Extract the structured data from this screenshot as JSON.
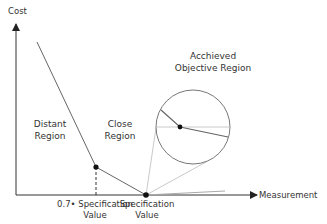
{
  "diagram": {
    "y_axis_label": "Cost",
    "x_axis_label": "Measurement",
    "regions": {
      "distant": [
        "Distant",
        "Region"
      ],
      "close": [
        "Close",
        "Region"
      ],
      "achieved": [
        "Acchieved",
        "Objective Region"
      ]
    },
    "x_ticks": {
      "tick1": [
        "0.7• Specification",
        "Value"
      ],
      "tick2": [
        "Specification",
        "Value"
      ]
    },
    "colors": {
      "axis": "#333333",
      "curve": "#555555",
      "guide": "#bbbbbb",
      "point": "#111111"
    }
  }
}
